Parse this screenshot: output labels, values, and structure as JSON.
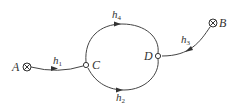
{
  "diagram": {
    "type": "flow-network",
    "nodes": [
      {
        "id": "A",
        "label": "A",
        "kind": "source-sink",
        "symbol": "circled-x"
      },
      {
        "id": "B",
        "label": "B",
        "kind": "source-sink",
        "symbol": "circled-x"
      },
      {
        "id": "C",
        "label": "C",
        "kind": "junction",
        "symbol": "open-circle"
      },
      {
        "id": "D",
        "label": "D",
        "kind": "junction",
        "symbol": "open-circle"
      }
    ],
    "edges": [
      {
        "id": "h1",
        "base": "h",
        "sub": "1",
        "from": "A",
        "to": "C"
      },
      {
        "id": "h2",
        "base": "h",
        "sub": "2",
        "from": "C",
        "to": "D",
        "path": "lower-arc"
      },
      {
        "id": "h3",
        "base": "h",
        "sub": "3",
        "from": "B",
        "to": "D"
      },
      {
        "id": "h4",
        "base": "h",
        "sub": "4",
        "from": "C",
        "to": "D",
        "path": "upper-arc"
      }
    ],
    "colors": {
      "line": "#444444",
      "text": "#333333",
      "background": "#ffffff"
    }
  }
}
